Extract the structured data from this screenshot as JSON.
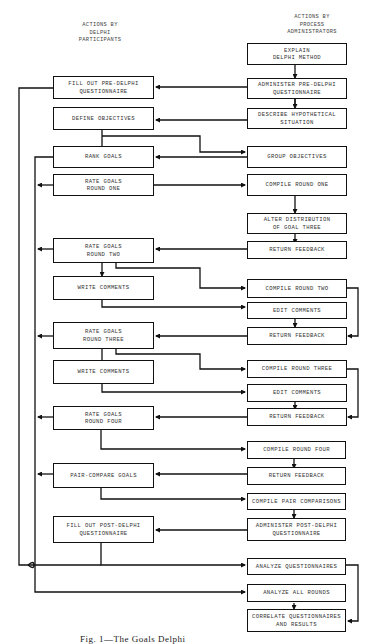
{
  "headers": {
    "participants": "ACTIONS BY\nDELPHI\nPARTICIPANTS",
    "administrators": "ACTIONS BY\nPROCESS\nADMINISTRATORS"
  },
  "participant_boxes": [
    {
      "id": "fill-out-pre-delphi",
      "label": "FILL OUT PRE-DELPHI\nQUESTIONNAIRE"
    },
    {
      "id": "define-objectives",
      "label": "DEFINE OBJECTIVES"
    },
    {
      "id": "rank-goals",
      "label": "RANK GOALS"
    },
    {
      "id": "rate-goals-round-one",
      "label": "RATE GOALS\nROUND ONE"
    },
    {
      "id": "rate-goals-round-two",
      "label": "RATE GOALS\nROUND TWO"
    },
    {
      "id": "write-comments-1",
      "label": "WRITE COMMENTS"
    },
    {
      "id": "rate-goals-round-three",
      "label": "RATE GOALS\nROUND THREE"
    },
    {
      "id": "write-comments-2",
      "label": "WRITE COMMENTS"
    },
    {
      "id": "rate-goals-round-four",
      "label": "RATE GOALS\nROUND FOUR"
    },
    {
      "id": "pair-compare-goals",
      "label": "PAIR-COMPARE GOALS"
    },
    {
      "id": "fill-out-post-delphi",
      "label": "FILL OUT POST-DELPHI\nQUESTIONNAIRE"
    }
  ],
  "administrator_boxes": [
    {
      "id": "explain-delphi-method",
      "label": "EXPLAIN\nDELPHI METHOD"
    },
    {
      "id": "administer-pre-delphi",
      "label": "ADMINISTER PRE-DELPHI\nQUESTIONNAIRE"
    },
    {
      "id": "describe-hypothetical",
      "label": "DESCRIBE HYPOTHETICAL\nSITUATION"
    },
    {
      "id": "group-objectives",
      "label": "GROUP OBJECTIVES"
    },
    {
      "id": "compile-round-one",
      "label": "COMPILE ROUND ONE"
    },
    {
      "id": "alter-distribution",
      "label": "ALTER DISTRIBUTION\nOF GOAL THREE"
    },
    {
      "id": "return-feedback-1",
      "label": "RETURN FEEDBACK"
    },
    {
      "id": "compile-round-two",
      "label": "COMPILE ROUND  TWO"
    },
    {
      "id": "edit-comments-1",
      "label": "EDIT COMMENTS"
    },
    {
      "id": "return-feedback-2",
      "label": "RETURN FEEDBACK"
    },
    {
      "id": "compile-round-three",
      "label": "COMPILE ROUND THREE"
    },
    {
      "id": "edit-comments-2",
      "label": "EDIT COMMENTS"
    },
    {
      "id": "return-feedback-3",
      "label": "RETURN FEEDBACK"
    },
    {
      "id": "compile-round-four",
      "label": "COMPILE ROUND FOUR"
    },
    {
      "id": "return-feedback-4",
      "label": "RETURN FEEDBACK"
    },
    {
      "id": "compile-pair-comparisons",
      "label": "COMPILE PAIR COMPARISONS"
    },
    {
      "id": "administer-post-delphi",
      "label": "ADMINISTER POST-DELPHI\nQUESTIONNAIRE"
    },
    {
      "id": "analyze-questionnaires",
      "label": "ANALYZE QUESTIONNAIRES"
    },
    {
      "id": "analyze-all-rounds",
      "label": "ANALYZE ALL ROUNDS"
    },
    {
      "id": "correlate-questionnaires",
      "label": "CORRELATE QUESTIONNAIRES\nAND RESULTS"
    }
  ],
  "caption": "Fig. 1—The Goals Delphi"
}
